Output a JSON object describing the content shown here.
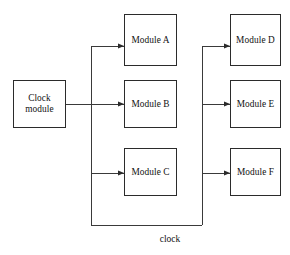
{
  "diagram": {
    "background_color": "#ffffff",
    "line_color": "#3a3a3a",
    "box_border_color": "#2b2b2b",
    "text_color": "#111111",
    "source": {
      "label": "Clock\nmodule",
      "line1": "Clock",
      "line2": "module"
    },
    "left_column": [
      {
        "label": "Module A"
      },
      {
        "label": "Module B"
      },
      {
        "label": "Module C"
      }
    ],
    "right_column": [
      {
        "label": "Module D"
      },
      {
        "label": "Module E"
      },
      {
        "label": "Module F"
      }
    ],
    "bus_caption": "clock"
  }
}
